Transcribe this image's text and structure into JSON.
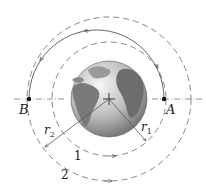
{
  "diagram": {
    "center": {
      "x": 109,
      "y": 99
    },
    "earth_radius": 38,
    "orbits": [
      {
        "id": "1",
        "label": "1",
        "radius": 57,
        "style": "dashed"
      },
      {
        "id": "2",
        "label": "2",
        "radius": 82,
        "style": "dashed"
      }
    ],
    "transfer_orbit": {
      "style": "solid",
      "from": "A",
      "to": "B"
    },
    "points": [
      {
        "label": "A",
        "x": 164,
        "y": 99
      },
      {
        "label": "B",
        "x": 29,
        "y": 99
      }
    ],
    "radius_labels": {
      "r1": "r",
      "r1_sub": "1",
      "r2": "r",
      "r2_sub": "2"
    },
    "colors": {
      "line": "#666666",
      "earth_dark": "#555555",
      "earth_light": "#e8e8e8"
    }
  }
}
